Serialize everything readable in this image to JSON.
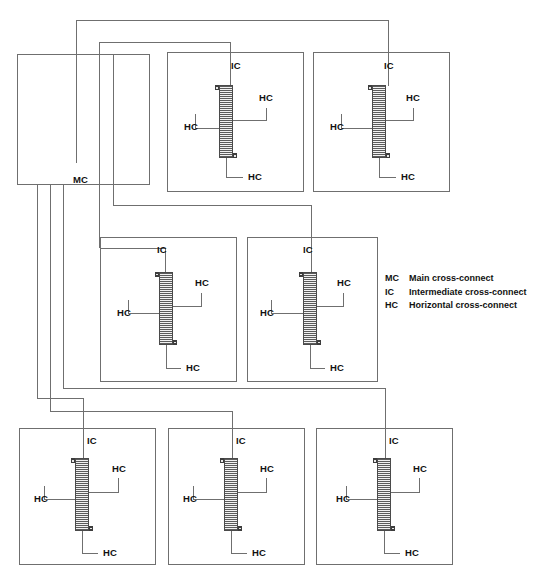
{
  "diagram": {
    "line_color": "#6f6f6f",
    "panel_color": "#4a4a4a",
    "background": "#ffffff"
  },
  "legend": {
    "entries": [
      {
        "abbr": "MC",
        "description": "Main cross-connect"
      },
      {
        "abbr": "IC",
        "description": "Intermediate cross-connect"
      },
      {
        "abbr": "HC",
        "description": "Horizontal cross-connect"
      }
    ]
  },
  "main_cross_connect": {
    "label": "MC",
    "x": 17,
    "y": 54,
    "width": 133,
    "height": 131
  },
  "intermediate_boxes": [
    {
      "id": "ic-top-left",
      "ic_label": "IC",
      "hc_labels": [
        "HC",
        "HC",
        "HC"
      ],
      "box": {
        "x": 167,
        "y": 52,
        "width": 137,
        "height": 140
      },
      "panel": {
        "x": 219,
        "y": 85,
        "width": 14,
        "height": 73
      }
    },
    {
      "id": "ic-top-right",
      "ic_label": "IC",
      "hc_labels": [
        "HC",
        "HC",
        "HC"
      ],
      "box": {
        "x": 313,
        "y": 52,
        "width": 137,
        "height": 140
      },
      "panel": {
        "x": 372,
        "y": 85,
        "width": 14,
        "height": 73
      }
    },
    {
      "id": "ic-mid-left",
      "ic_label": "IC",
      "hc_labels": [
        "HC",
        "HC",
        "HC"
      ],
      "box": {
        "x": 100,
        "y": 237,
        "width": 137,
        "height": 145
      },
      "panel": {
        "x": 159,
        "y": 272,
        "width": 14,
        "height": 73
      }
    },
    {
      "id": "ic-mid-right",
      "ic_label": "IC",
      "hc_labels": [
        "HC",
        "HC",
        "HC"
      ],
      "box": {
        "x": 247,
        "y": 237,
        "width": 131,
        "height": 145
      },
      "panel": {
        "x": 303,
        "y": 272,
        "width": 14,
        "height": 73
      }
    },
    {
      "id": "ic-bot-left",
      "ic_label": "IC",
      "hc_labels": [
        "HC",
        "HC",
        "HC"
      ],
      "box": {
        "x": 19,
        "y": 428,
        "width": 137,
        "height": 137
      },
      "panel": {
        "x": 75,
        "y": 458,
        "width": 14,
        "height": 73
      }
    },
    {
      "id": "ic-bot-mid",
      "ic_label": "IC",
      "hc_labels": [
        "HC",
        "HC",
        "HC"
      ],
      "box": {
        "x": 168,
        "y": 428,
        "width": 137,
        "height": 137
      },
      "panel": {
        "x": 224,
        "y": 458,
        "width": 14,
        "height": 73
      }
    },
    {
      "id": "ic-bot-right",
      "ic_label": "IC",
      "hc_labels": [
        "HC",
        "HC",
        "HC"
      ],
      "box": {
        "x": 316,
        "y": 428,
        "width": 137,
        "height": 137
      },
      "panel": {
        "x": 377,
        "y": 458,
        "width": 14,
        "height": 73
      }
    }
  ],
  "wire_paths": {
    "trunk_top_right": "M 226,98 L 226,20 L 379,20 L 379,85",
    "trunk_top_left": "M 98,122 L 98,42 L 314,42 L 314,66 L 226,66 L 226,85",
    "trunk_mid_right": "M 113,126 L 113,205 L 310,205 L 310,272",
    "trunk_mid_left": "M 75,19 L 75,166 L 75,240 L 104,240 L 104,278 L 166,278 L 166,272",
    "drop_bot_left": "M 37,186 L 37,398 L 82,398 L 82,458",
    "drop_bot_mid": "M 49,186 L 49,410 L 231,410 L 231,458",
    "drop_bot_right": "M 62,186 L 62,390 L 384,390 L 384,458"
  }
}
